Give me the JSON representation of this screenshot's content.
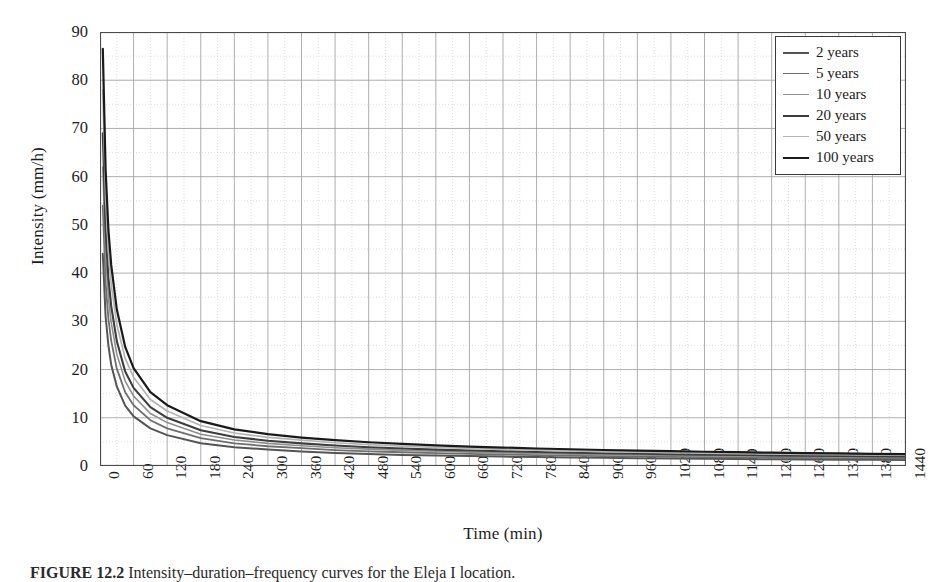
{
  "figure": {
    "caption": "FIGURE 12.2   Intensity–duration–frequency curves for the Eleja I location."
  },
  "axes": {
    "ylabel": "Intensity (mm/h)",
    "xlabel": "Time (min)",
    "yticks": [
      "0",
      "10",
      "20",
      "30",
      "40",
      "50",
      "60",
      "70",
      "80",
      "90"
    ],
    "xticks": [
      "0",
      "60",
      "120",
      "180",
      "240",
      "300",
      "360",
      "420",
      "480",
      "540",
      "600",
      "660",
      "720",
      "780",
      "840",
      "900",
      "960",
      "1020",
      "1080",
      "1140",
      "1200",
      "1260",
      "1320",
      "1380",
      "1440"
    ]
  },
  "legend": {
    "items": [
      {
        "label": "2 years",
        "color": "#555555",
        "width": 2.0
      },
      {
        "label": "5 years",
        "color": "#6e6e6e",
        "width": 1.8
      },
      {
        "label": "10 years",
        "color": "#8f8f8f",
        "width": 1.6
      },
      {
        "label": "20 years",
        "color": "#3d3d3d",
        "width": 2.1
      },
      {
        "label": "50 years",
        "color": "#b4b4b4",
        "width": 1.7
      },
      {
        "label": "100 years",
        "color": "#1a1a1a",
        "width": 2.2
      }
    ]
  },
  "chart_data": {
    "type": "line",
    "title": "",
    "xlabel": "Time (min)",
    "ylabel": "Intensity (mm/h)",
    "xlim": [
      0,
      1440
    ],
    "ylim": [
      0,
      90
    ],
    "xtick_step": 60,
    "ytick_step": 10,
    "yminor_step": 5,
    "grid": true,
    "legend_position": "top-right",
    "x": [
      5,
      10,
      15,
      20,
      30,
      45,
      60,
      90,
      120,
      180,
      240,
      300,
      360,
      420,
      480,
      540,
      600,
      660,
      720,
      780,
      840,
      900,
      960,
      1020,
      1080,
      1140,
      1200,
      1260,
      1320,
      1380,
      1440
    ],
    "series": [
      {
        "name": "2 years",
        "color": "#555555",
        "values": [
          44.0,
          31.0,
          25.0,
          21.0,
          16.5,
          12.5,
          10.3,
          7.8,
          6.4,
          4.7,
          3.9,
          3.4,
          3.0,
          2.7,
          2.5,
          2.3,
          2.2,
          2.05,
          1.95,
          1.85,
          1.75,
          1.7,
          1.62,
          1.56,
          1.5,
          1.45,
          1.4,
          1.36,
          1.32,
          1.28,
          1.25
        ]
      },
      {
        "name": "5 years",
        "color": "#6e6e6e",
        "values": [
          54.0,
          38.0,
          30.5,
          26.0,
          20.2,
          15.3,
          12.6,
          9.5,
          7.8,
          5.8,
          4.7,
          4.1,
          3.7,
          3.3,
          3.05,
          2.85,
          2.65,
          2.5,
          2.38,
          2.25,
          2.15,
          2.05,
          1.97,
          1.9,
          1.83,
          1.77,
          1.71,
          1.66,
          1.61,
          1.57,
          1.53
        ]
      },
      {
        "name": "10 years",
        "color": "#8f8f8f",
        "values": [
          62.0,
          44.0,
          35.0,
          29.8,
          23.2,
          17.6,
          14.5,
          10.9,
          9.0,
          6.6,
          5.4,
          4.7,
          4.2,
          3.8,
          3.5,
          3.25,
          3.05,
          2.88,
          2.73,
          2.6,
          2.47,
          2.36,
          2.27,
          2.18,
          2.1,
          2.03,
          1.97,
          1.91,
          1.85,
          1.8,
          1.75
        ]
      },
      {
        "name": "20 years",
        "color": "#3d3d3d",
        "values": [
          69.0,
          49.0,
          39.0,
          33.2,
          25.9,
          19.6,
          16.2,
          12.2,
          10.0,
          7.4,
          6.0,
          5.25,
          4.7,
          4.25,
          3.9,
          3.63,
          3.4,
          3.2,
          3.05,
          2.9,
          2.76,
          2.64,
          2.53,
          2.43,
          2.35,
          2.27,
          2.2,
          2.13,
          2.07,
          2.01,
          1.96
        ]
      },
      {
        "name": "50 years",
        "color": "#b4b4b4",
        "values": [
          78.0,
          55.5,
          44.3,
          37.7,
          29.4,
          22.3,
          18.4,
          13.8,
          11.4,
          8.4,
          6.85,
          5.95,
          5.35,
          4.82,
          4.45,
          4.12,
          3.86,
          3.64,
          3.45,
          3.29,
          3.14,
          3.0,
          2.88,
          2.77,
          2.67,
          2.58,
          2.5,
          2.42,
          2.35,
          2.29,
          2.23
        ]
      },
      {
        "name": "100 years",
        "color": "#1a1a1a",
        "values": [
          86.5,
          61.5,
          49.0,
          41.7,
          32.5,
          24.7,
          20.3,
          15.3,
          12.6,
          9.3,
          7.6,
          6.6,
          5.9,
          5.35,
          4.92,
          4.57,
          4.27,
          4.03,
          3.82,
          3.63,
          3.47,
          3.32,
          3.19,
          3.07,
          2.96,
          2.86,
          2.76,
          2.68,
          2.6,
          2.53,
          2.47
        ]
      }
    ]
  }
}
